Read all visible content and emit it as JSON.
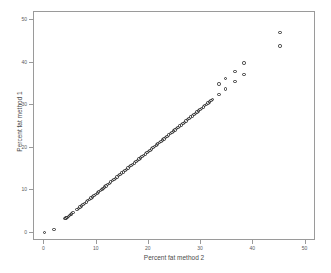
{
  "figure": {
    "title": "",
    "background_color": "#ffffff",
    "frame_color": "#9a9a9a",
    "marker_color": "#333333"
  },
  "chart_data": {
    "type": "scatter",
    "title": "",
    "subtitle": "",
    "xlabel": "Percent fat method 2",
    "ylabel": "Percent fat method 1",
    "xlim": [
      -2,
      52
    ],
    "ylim": [
      -2,
      52
    ],
    "xticks": [
      0,
      10,
      20,
      30,
      40,
      50
    ],
    "xtick_labels": [
      "0",
      "10",
      "20",
      "30",
      "40",
      "50"
    ],
    "yticks": [
      0,
      10,
      20,
      30,
      40,
      50
    ],
    "ytick_labels": [
      "0",
      "10",
      "20",
      "30",
      "40",
      "50"
    ],
    "grid": false,
    "legend": false,
    "legend_position": "none",
    "marker": "open-circle",
    "series": [
      {
        "name": "Percent fat method 1 vs method 2",
        "x": [
          0.0,
          1.8,
          3.9,
          4.1,
          4.3,
          4.6,
          4.8,
          5.0,
          5.2,
          5.5,
          6.2,
          6.5,
          6.8,
          7.1,
          7.4,
          7.7,
          8.0,
          8.3,
          8.6,
          8.9,
          9.2,
          9.5,
          9.8,
          10.1,
          10.4,
          10.7,
          11.0,
          11.2,
          11.5,
          11.8,
          12.1,
          12.4,
          12.7,
          13.0,
          13.3,
          13.6,
          13.9,
          14.2,
          14.5,
          14.8,
          15.1,
          15.4,
          15.7,
          16.0,
          16.3,
          16.6,
          16.9,
          17.2,
          17.5,
          17.8,
          18.1,
          18.4,
          18.7,
          19.0,
          19.3,
          19.6,
          19.9,
          20.2,
          20.5,
          20.8,
          21.1,
          21.4,
          21.7,
          22.0,
          22.3,
          22.6,
          22.9,
          23.2,
          23.5,
          23.8,
          24.1,
          24.4,
          24.7,
          25.0,
          25.3,
          25.6,
          25.9,
          26.2,
          26.5,
          26.8,
          27.1,
          27.4,
          27.7,
          28.0,
          28.3,
          28.6,
          28.9,
          29.2,
          29.5,
          29.8,
          30.1,
          30.4,
          30.7,
          31.0,
          31.3,
          31.6,
          31.9,
          32.2,
          33.4,
          34.7,
          36.5,
          38.2,
          45.1
        ],
        "y": [
          0.0,
          0.7,
          3.3,
          3.4,
          3.6,
          3.8,
          4.0,
          4.2,
          4.4,
          4.7,
          5.4,
          5.7,
          6.0,
          6.3,
          6.6,
          6.9,
          7.2,
          7.5,
          7.8,
          8.1,
          8.4,
          8.7,
          9.0,
          9.3,
          9.6,
          9.9,
          10.2,
          10.4,
          10.7,
          11.0,
          11.3,
          11.6,
          11.9,
          12.2,
          12.5,
          12.8,
          13.1,
          13.4,
          13.7,
          14.0,
          14.3,
          14.6,
          14.9,
          15.2,
          15.5,
          15.8,
          16.1,
          16.4,
          16.7,
          17.0,
          17.3,
          17.6,
          17.9,
          18.2,
          18.5,
          18.8,
          19.1,
          19.4,
          19.7,
          20.0,
          20.3,
          20.6,
          20.9,
          21.2,
          21.5,
          21.8,
          22.1,
          22.4,
          22.7,
          23.0,
          23.3,
          23.6,
          23.9,
          24.2,
          24.5,
          24.8,
          25.1,
          25.4,
          25.7,
          26.0,
          26.3,
          26.6,
          26.9,
          27.2,
          27.5,
          27.8,
          28.1,
          28.4,
          28.7,
          29.0,
          29.3,
          29.6,
          29.9,
          30.2,
          30.5,
          30.8,
          31.1,
          31.4,
          32.6,
          33.8,
          35.6,
          37.3,
          44.0
        ]
      }
    ],
    "annotations": [
      {
        "text": "Outlier at upper right",
        "x": 45.1,
        "y": 47.2
      },
      {
        "text": "Low pair near origin",
        "x": 0.0,
        "y": 0.0
      }
    ],
    "outlier_points": {
      "x": [
        33.4,
        34.7,
        36.5,
        38.2,
        45.1
      ],
      "y": [
        35.0,
        36.3,
        38.0,
        40.0,
        47.2
      ]
    }
  }
}
